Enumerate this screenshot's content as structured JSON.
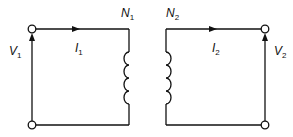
{
  "diagram": {
    "primary": {
      "turns_label": "N",
      "turns_sub": "1",
      "current_label": "I",
      "current_sub": "1",
      "voltage_label": "V",
      "voltage_sub": "1"
    },
    "secondary": {
      "turns_label": "N",
      "turns_sub": "2",
      "current_label": "I",
      "current_sub": "2",
      "voltage_label": "V",
      "voltage_sub": "2"
    },
    "colors": {
      "line": "#111111",
      "background": "#ffffff"
    }
  }
}
